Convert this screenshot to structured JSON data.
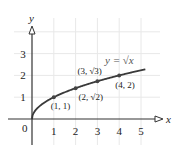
{
  "chart_data": {
    "type": "line",
    "title": "",
    "xlabel": "x",
    "ylabel": "y",
    "xlim": [
      0,
      5.5
    ],
    "ylim": [
      0,
      3.8
    ],
    "grid": true,
    "x_ticks": [
      "1",
      "2",
      "3",
      "4",
      "5"
    ],
    "y_ticks": [
      "1",
      "2",
      "3"
    ],
    "origin_label": "0",
    "series": [
      {
        "name": "y = √x",
        "function": "sqrt",
        "x_range": [
          0,
          5.2
        ],
        "color": "#333333"
      }
    ],
    "points": [
      {
        "x": 1,
        "y": 1,
        "label": "(1, 1)"
      },
      {
        "x": 2,
        "y": 1.414,
        "label": "(2, √2)"
      },
      {
        "x": 3,
        "y": 1.732,
        "label": "(3, √3)"
      },
      {
        "x": 4,
        "y": 2,
        "label": "(4, 2)"
      }
    ],
    "curve_label": "y = √x",
    "legend": "none"
  },
  "colors": {
    "axis": "#333333",
    "curve": "#3a3a3a",
    "grid": "#e8e8e8",
    "point": "#444444"
  }
}
